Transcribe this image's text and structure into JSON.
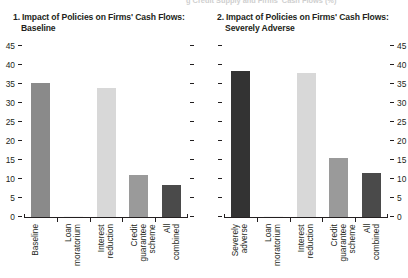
{
  "top_cutoff_text": "g Credit Supply and Firms' Cash Flows  (%)",
  "panels": [
    {
      "number": "1.",
      "title_line1": "Impact of Policies on Firms' Cash Flows:",
      "title_line2": "Baseline",
      "axis_side": "left",
      "categories": [
        "Baseline",
        "Loan\nmoratorium",
        "Interest\nreduction",
        "Credit\nguarantee\nscheme",
        "All\ncombined"
      ],
      "values": [
        35.3,
        0.3,
        34.0,
        11.0,
        8.4
      ],
      "colors": [
        "#8a8a8a",
        "#f5f5f5",
        "#d8d8d8",
        "#9a9a9a",
        "#4a4a4a"
      ]
    },
    {
      "number": "2.",
      "title_line1": "Impact of Policies on Firms' Cash Flows:",
      "title_line2": "Severely Adverse",
      "axis_side": "right",
      "categories": [
        "Severely\nadverse",
        "Loan\nmoratorium",
        "Interest\nreduction",
        "Credit\nguarantee\nscheme",
        "All\ncombined"
      ],
      "values": [
        38.5,
        0.3,
        38.0,
        15.5,
        11.5
      ],
      "colors": [
        "#333333",
        "#f5f5f5",
        "#d8d8d8",
        "#9a9a9a",
        "#4a4a4a"
      ]
    }
  ],
  "yticks": [
    "0",
    "5",
    "10",
    "15",
    "20",
    "25",
    "30",
    "35",
    "40",
    "45"
  ],
  "chart_data": {
    "type": "bar",
    "title": "Impact of Policies on Firms' Cash Flows",
    "ylim": [
      0,
      45
    ],
    "ytick_values": [
      0,
      5,
      10,
      15,
      20,
      25,
      30,
      35,
      40,
      45
    ],
    "grid": false,
    "legend": "none",
    "xlabel": "",
    "ylabel": "",
    "panels": [
      {
        "panel": "1. Impact of Policies on Firms' Cash Flows: Baseline",
        "categories": [
          "Baseline",
          "Loan moratorium",
          "Interest reduction",
          "Credit guarantee scheme",
          "All combined"
        ],
        "values": [
          35.3,
          0.3,
          34.0,
          11.0,
          8.4
        ],
        "ylim": [
          0,
          45
        ],
        "axis_labels_side": "left"
      },
      {
        "panel": "2. Impact of Policies on Firms' Cash Flows: Severely Adverse",
        "categories": [
          "Severely adverse",
          "Loan moratorium",
          "Interest reduction",
          "Credit guarantee scheme",
          "All combined"
        ],
        "values": [
          38.5,
          0.3,
          38.0,
          15.5,
          11.5
        ],
        "ylim": [
          0,
          45
        ],
        "axis_labels_side": "right"
      }
    ]
  }
}
